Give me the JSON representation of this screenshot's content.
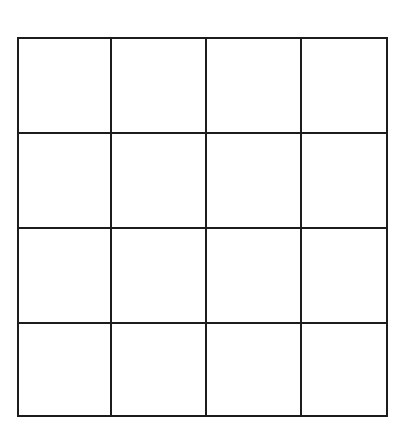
{
  "grid": {
    "rows": 4,
    "cols": 4,
    "x_lines": [
      18,
      111,
      206,
      301,
      387
    ],
    "y_lines": [
      38,
      133,
      228,
      323,
      416
    ],
    "line_color": "#1c1c1c",
    "line_width": 2,
    "background": "#ffffff"
  }
}
